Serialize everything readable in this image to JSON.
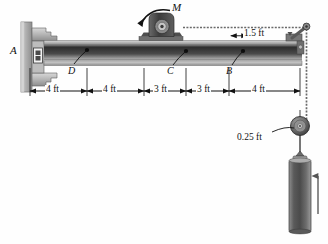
{
  "figure": {
    "type": "statics-free-body-diagram",
    "background_color": "#fefefe",
    "ink_color": "#111111",
    "beam_dark": "#3a3a3a",
    "beam_light": "#c8c8c8",
    "hardware_color": "#555555"
  },
  "labels": {
    "support_a": "A",
    "point_d": "D",
    "point_c": "C",
    "point_b": "B",
    "moment": "M"
  },
  "dimensions": {
    "segments": [
      {
        "value": "4 ft",
        "from": "A",
        "to": "D"
      },
      {
        "value": "4 ft",
        "from": "D",
        "to": "mid"
      },
      {
        "value": "3 ft",
        "from": "mid",
        "to": "C"
      },
      {
        "value": "3 ft",
        "from": "C",
        "to": "B"
      },
      {
        "value": "4 ft",
        "from": "B",
        "to": "end"
      }
    ],
    "cable_offset": "1.5 ft",
    "pulley_radius": "0.25 ft",
    "total_length": "18 ft"
  },
  "components": {
    "wall": "fixed-wall-support",
    "beam": "horizontal-i-beam",
    "motor": "motor-housing-on-beam",
    "pulley": "cable-pulley",
    "weight": "hanging-cylindrical-weight",
    "cable": "tension-cable",
    "bracket": "end-bracket-cable-anchor"
  }
}
